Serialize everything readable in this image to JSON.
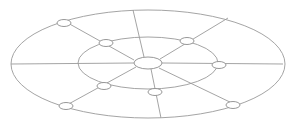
{
  "diagram": {
    "type": "radial-network",
    "width": 295,
    "height": 122,
    "colors": {
      "stroke": "#9a9a9a",
      "node_fill": "#ffffff",
      "background": "#ffffff"
    },
    "center": {
      "cx": 148,
      "cy": 63,
      "rx": 14,
      "ry": 6
    },
    "outer_ring": {
      "cx": 148,
      "cy": 64,
      "rx": 137,
      "ry": 54
    },
    "inner_ring": {
      "cx": 148,
      "cy": 63,
      "rx": 70,
      "ry": 26
    },
    "spokes": [
      {
        "x1": 134,
        "y1": 60,
        "x2": 66,
        "y2": 22
      },
      {
        "x1": 144,
        "y1": 57,
        "x2": 133,
        "y2": 10
      },
      {
        "x1": 160,
        "y1": 59,
        "x2": 228,
        "y2": 18
      },
      {
        "x1": 162,
        "y1": 63,
        "x2": 283,
        "y2": 64
      },
      {
        "x1": 159,
        "y1": 68,
        "x2": 234,
        "y2": 104
      },
      {
        "x1": 151,
        "y1": 69,
        "x2": 161,
        "y2": 118
      },
      {
        "x1": 136,
        "y1": 67,
        "x2": 65,
        "y2": 106
      },
      {
        "x1": 134,
        "y1": 63,
        "x2": 11,
        "y2": 64
      }
    ],
    "nodes": [
      {
        "cx": 64,
        "cy": 23,
        "rx": 7,
        "ry": 3.5,
        "ring": "outer"
      },
      {
        "cx": 106,
        "cy": 43,
        "rx": 7,
        "ry": 3.5,
        "ring": "inner"
      },
      {
        "cx": 187,
        "cy": 41,
        "rx": 7,
        "ry": 3.5,
        "ring": "inner"
      },
      {
        "cx": 219,
        "cy": 65,
        "rx": 7,
        "ry": 3.5,
        "ring": "inner"
      },
      {
        "cx": 233,
        "cy": 105,
        "rx": 7,
        "ry": 3.5,
        "ring": "outer"
      },
      {
        "cx": 155,
        "cy": 92,
        "rx": 7,
        "ry": 3.5,
        "ring": "inner"
      },
      {
        "cx": 104,
        "cy": 86,
        "rx": 7,
        "ry": 3.5,
        "ring": "inner"
      },
      {
        "cx": 66,
        "cy": 106,
        "rx": 7,
        "ry": 3.5,
        "ring": "outer"
      }
    ]
  }
}
